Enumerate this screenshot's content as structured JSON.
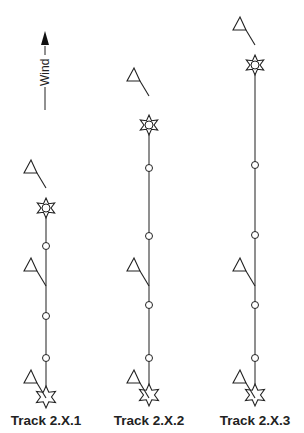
{
  "wind_indicator": {
    "label": "Wind",
    "direction": "up"
  },
  "tracks": [
    {
      "label": "Track 2.X.1",
      "x": 46,
      "start_star_y": 397,
      "end_star_y": 208,
      "marks_y": [
        246,
        316,
        358
      ],
      "flags": [
        {
          "x": 24,
          "y": 160
        },
        {
          "x": 24,
          "y": 258
        },
        {
          "x": 24,
          "y": 370
        }
      ]
    },
    {
      "label": "Track 2.X.2",
      "x": 149,
      "start_star_y": 395,
      "end_star_y": 125,
      "marks_y": [
        168,
        236,
        305,
        358
      ],
      "flags": [
        {
          "x": 127,
          "y": 68
        },
        {
          "x": 127,
          "y": 258
        },
        {
          "x": 127,
          "y": 370
        }
      ]
    },
    {
      "label": "Track 2.X.3",
      "x": 255,
      "start_star_y": 395,
      "end_star_y": 65,
      "marks_y": [
        165,
        235,
        305,
        358
      ],
      "flags": [
        {
          "x": 233,
          "y": 17
        },
        {
          "x": 233,
          "y": 258
        },
        {
          "x": 233,
          "y": 370
        }
      ]
    }
  ]
}
